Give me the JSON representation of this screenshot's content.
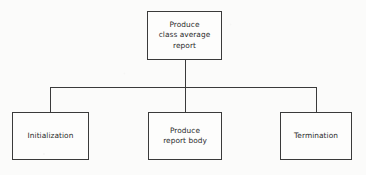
{
  "diagram": {
    "type": "structure-chart",
    "background_color": "#fbfbfa",
    "line_color": "#3a3a3a",
    "text_color": "#2b2b2b",
    "canvas": {
      "width": 366,
      "height": 175
    },
    "nodes": [
      {
        "id": "root",
        "name": "produce-class-average-report",
        "label": "Produce\nclass average\nreport",
        "level": 0,
        "x": 147,
        "y": 11,
        "width": 75,
        "height": 49
      },
      {
        "id": "initialization",
        "name": "initialization",
        "label": "Initialization",
        "level": 1,
        "x": 12,
        "y": 112,
        "width": 77,
        "height": 48
      },
      {
        "id": "produce-report-body",
        "name": "produce-report-body",
        "label": "Produce\nreport body",
        "level": 1,
        "x": 148,
        "y": 112,
        "width": 74,
        "height": 48
      },
      {
        "id": "termination",
        "name": "termination",
        "label": "Termination",
        "level": 1,
        "x": 280,
        "y": 112,
        "width": 72,
        "height": 48
      }
    ],
    "connectors": {
      "root_stem": {
        "x": 185,
        "y_start": 60,
        "y_end": 87
      },
      "bus": {
        "x_start": 50,
        "x_end": 316,
        "y": 87
      },
      "drops": [
        {
          "to": "initialization",
          "x": 50,
          "y_start": 87,
          "y_end": 112
        },
        {
          "to": "produce-report-body",
          "x": 185,
          "y_start": 87,
          "y_end": 112
        },
        {
          "to": "termination",
          "x": 316,
          "y_start": 87,
          "y_end": 112
        }
      ]
    }
  }
}
